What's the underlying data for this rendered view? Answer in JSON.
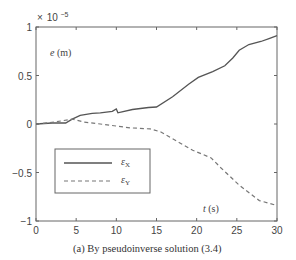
{
  "chart_data": {
    "type": "line",
    "title": "",
    "caption": "(a) By pseudoinverse solution (3.4)",
    "xlabel": "t (s)",
    "ylabel": "e (m)",
    "y_scale_note": "× 10^-5",
    "xlim": [
      0,
      30
    ],
    "ylim": [
      -1,
      1
    ],
    "x_ticks": [
      0,
      5,
      10,
      15,
      20,
      25,
      30
    ],
    "x_tick_labels": [
      "0",
      "5",
      "10",
      "15",
      "20",
      "25",
      "30"
    ],
    "y_ticks": [
      -1,
      -0.5,
      0,
      0.5,
      1
    ],
    "y_tick_labels": [
      "−1",
      "−0.5",
      "0",
      "0.5",
      "1"
    ],
    "grid": false,
    "legend_position": "lower left (inside)",
    "series": [
      {
        "name": "εX",
        "style": "solid",
        "color": "#555555",
        "x": [
          0,
          2,
          3.7,
          4.5,
          5.5,
          7,
          8,
          9.5,
          10,
          10.2,
          12,
          14,
          15,
          17,
          19,
          20.2,
          22,
          23.5,
          24.5,
          25.3,
          26.5,
          28,
          29,
          30
        ],
        "y": [
          0,
          0.01,
          0.01,
          0.05,
          0.09,
          0.11,
          0.115,
          0.13,
          0.155,
          0.115,
          0.15,
          0.17,
          0.175,
          0.28,
          0.41,
          0.48,
          0.54,
          0.6,
          0.68,
          0.76,
          0.82,
          0.85,
          0.88,
          0.91
        ]
      },
      {
        "name": "εY",
        "style": "dashed",
        "color": "#777777",
        "x": [
          0,
          2.3,
          4.5,
          6,
          8,
          11.8,
          14.2,
          15.5,
          17.8,
          19.5,
          21.8,
          23,
          25.3,
          27.8,
          30
        ],
        "y": [
          0,
          0.02,
          0.05,
          0.02,
          0.0,
          -0.04,
          -0.05,
          -0.08,
          -0.19,
          -0.27,
          -0.35,
          -0.45,
          -0.63,
          -0.79,
          -0.84
        ]
      }
    ]
  },
  "labels": {
    "y_exponent_x": "×",
    "y_exponent_base": "10",
    "y_exponent_power": "−5",
    "ylabel_var": "e",
    "ylabel_unit": " (m)",
    "xlabel_var": "t",
    "xlabel_unit": " (s)",
    "legend_x_sym": "ε",
    "legend_x_sub": "X",
    "legend_y_sym": "ε",
    "legend_y_sub": "Y",
    "caption": "(a) By pseudoinverse solution (3.4)"
  }
}
